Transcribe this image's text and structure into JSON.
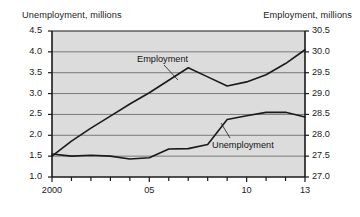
{
  "chart_data": {
    "type": "line",
    "title": "",
    "subtitle": "",
    "xlabel": "",
    "grid": true,
    "legend_position": "inline-annotations",
    "x": [
      2000,
      2001,
      2002,
      2003,
      2004,
      2005,
      2006,
      2007,
      2008,
      2009,
      2010,
      2011,
      2012,
      2013
    ],
    "x_tick_labels": [
      "2000",
      "05",
      "10",
      "13"
    ],
    "x_tick_values": [
      2000,
      2005,
      2010,
      2013
    ],
    "x_minor_ticks": [
      2001,
      2002,
      2003,
      2004,
      2006,
      2007,
      2008,
      2009,
      2011,
      2012
    ],
    "xlim": [
      2000,
      2013
    ],
    "axes": [
      {
        "id": "left",
        "label": "Unemployment, millions",
        "ylim": [
          1.0,
          4.5
        ],
        "ticks": [
          1.0,
          1.5,
          2.0,
          2.5,
          3.0,
          3.5,
          4.0,
          4.5
        ],
        "tick_labels": [
          "1.0",
          "1.5",
          "2.0",
          "2.5",
          "3.0",
          "3.5",
          "4.0",
          "4.5"
        ]
      },
      {
        "id": "right",
        "label": "Employment, millions",
        "ylim": [
          27.0,
          30.5
        ],
        "ticks": [
          27.0,
          27.5,
          28.0,
          28.5,
          29.0,
          29.5,
          30.0,
          30.5
        ],
        "tick_labels": [
          "27.0",
          "27.5",
          "28.0",
          "28.5",
          "29.0",
          "29.5",
          "30.0",
          "30.5"
        ]
      }
    ],
    "series": [
      {
        "name": "Unemployment",
        "axis": "left",
        "annotation": "Unemployment",
        "color": "#1a1a1a",
        "values": [
          1.55,
          1.5,
          1.52,
          1.5,
          1.43,
          1.46,
          1.67,
          1.68,
          1.78,
          2.38,
          2.47,
          2.55,
          2.55,
          2.44
        ]
      },
      {
        "name": "Employment",
        "axis": "right",
        "annotation": "Employment",
        "color": "#1a1a1a",
        "values": [
          27.5,
          27.86,
          28.17,
          28.46,
          28.75,
          29.02,
          29.32,
          29.62,
          29.4,
          29.18,
          29.28,
          29.45,
          29.72,
          30.05
        ]
      }
    ],
    "annotations": [
      {
        "text": "Employment",
        "x": 2005.2,
        "y_axis": "right",
        "y": 29.95
      },
      {
        "text": "Unemployment",
        "x": 2009.3,
        "y_axis": "left",
        "y": 1.85
      }
    ]
  },
  "style": {
    "plot_background": "#dcdcdc",
    "grid_color": "#6e6e6e",
    "axis_color": "#1a1a1a",
    "line_color": "#1a1a1a",
    "page_background": "#ffffff"
  }
}
